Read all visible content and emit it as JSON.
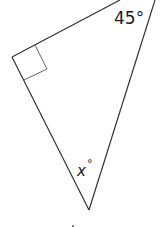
{
  "diagram": {
    "type": "right triangle",
    "angles": {
      "top_right": "45°",
      "bottom": "x°",
      "left": "right angle"
    },
    "labels": {
      "angle_45": "45°",
      "angle_x_var": "x",
      "angle_x_deg": "°"
    },
    "colors": {
      "line": "#333333",
      "right_angle_marker": "#555555",
      "background": "#ffffff"
    }
  }
}
